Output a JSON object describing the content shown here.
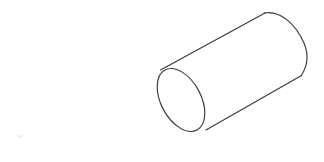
{
  "canvas": {
    "width": 324,
    "height": 162,
    "background_color": "#ffffff",
    "title": "Cylinder"
  },
  "figure": {
    "name": "cylinder",
    "description": "Outline line drawing of a three-dimensional cylinder shown in oblique view, tilted so its axis runs from lower-left to upper-right",
    "stroke_color": "#3a3a3c",
    "fill_color": "#ffffff",
    "stroke_width": 1.15,
    "style": "line-art-outline",
    "shaded": false,
    "hidden_lines_shown": false
  },
  "geometry": {
    "axis_angle_degrees": -28,
    "near_face": {
      "name": "near-circular-face",
      "shape": "ellipse",
      "center_x": 181,
      "center_y": 100,
      "radius_major": 34,
      "radius_minor": 20,
      "rotation_degrees": 62,
      "visible": "full-outline"
    },
    "far_face": {
      "name": "far-circular-face",
      "shape": "ellipse",
      "center_x": 285,
      "center_y": 44,
      "radius_major": 34,
      "radius_minor": 20,
      "rotation_degrees": 62,
      "visible": "back-arc-only"
    },
    "top_silhouette_line": {
      "name": "top-edge",
      "from_x": 161,
      "from_y": 70,
      "to_x": 265,
      "to_y": 13
    },
    "bottom_silhouette_line": {
      "name": "bottom-edge",
      "from_x": 206,
      "from_y": 130,
      "to_x": 301,
      "to_y": 76
    },
    "extents": {
      "left_x": 155,
      "right_x": 307,
      "top_y": 12,
      "bottom_y": 134
    }
  },
  "artifacts": {
    "speck": {
      "name": "faint-speck",
      "x": 17,
      "y": 135,
      "color": "#f2f2f2",
      "visible": true
    }
  }
}
